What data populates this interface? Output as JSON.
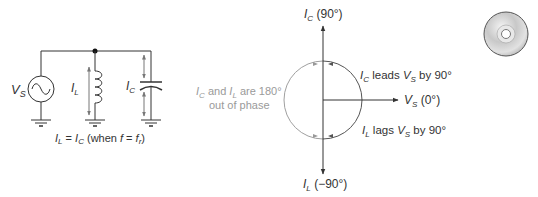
{
  "circuit": {
    "source_label": {
      "main": "V",
      "sub": "S"
    },
    "inductor_label": {
      "main": "I",
      "sub": "L"
    },
    "capacitor_label": {
      "main": "I",
      "sub": "C"
    },
    "caption": {
      "p1_main": "I",
      "p1_sub": "L",
      "eq": " = ",
      "p2_main": "I",
      "p2_sub": "C",
      "p3": " (when ",
      "p4_main": "f",
      "p5": " = ",
      "p6_main": "f",
      "p6_sub": "r",
      "p7": ")"
    }
  },
  "phasor": {
    "top_label": {
      "main": "I",
      "sub": "C",
      "rest": " (90°)"
    },
    "bottom_label": {
      "main": "I",
      "sub": "L",
      "rest": " (−90°)"
    },
    "right_label": {
      "main": "V",
      "sub": "S",
      "rest": " (0°)"
    },
    "leads_label": {
      "a_main": "I",
      "a_sub": "C",
      "mid": " leads ",
      "b_main": "V",
      "b_sub": "S",
      "rest": " by 90°"
    },
    "lags_label": {
      "a_main": "I",
      "a_sub": "L",
      "mid": " lags ",
      "b_main": "V",
      "b_sub": "S",
      "rest": " by 90°"
    },
    "phase_note": {
      "line1_a_main": "I",
      "line1_a_sub": "C",
      "line1_mid": " and ",
      "line1_b_main": "I",
      "line1_b_sub": "L",
      "line1_rest": " are 180°",
      "line2": "out of phase"
    }
  },
  "icons": {
    "cd": "cd-disc-icon"
  },
  "colors": {
    "line": "#333333",
    "gray_text": "#9a9a9a",
    "circle_dark": "#555555",
    "circle_light": "#a0a0a0"
  }
}
